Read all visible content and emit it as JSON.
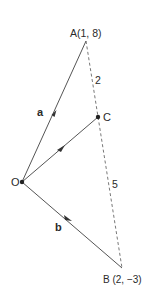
{
  "diagram": {
    "type": "vector-geometry",
    "points": {
      "A": {
        "label": "A(1, 8)",
        "x": 86,
        "y": 41
      },
      "O": {
        "label": "O",
        "x": 22,
        "y": 182
      },
      "C": {
        "label": "C",
        "x": 98,
        "y": 117
      },
      "B": {
        "label": "B (2, −3)",
        "x": 122,
        "y": 268
      }
    },
    "vectors": {
      "a": {
        "label": "a",
        "from": "O",
        "to": "A"
      },
      "b": {
        "label": "b",
        "from": "O",
        "to": "B"
      },
      "c": {
        "from": "O",
        "to": "C"
      }
    },
    "segments": {
      "AC_ratio": "2",
      "CB_ratio": "5"
    },
    "colors": {
      "line": "#555555",
      "text": "#2a2a2a",
      "background": "#ffffff"
    }
  }
}
